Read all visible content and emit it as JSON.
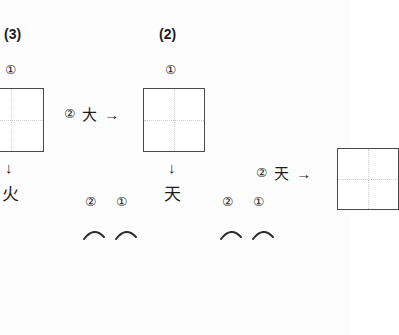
{
  "page": {
    "kind": "chinese-character-stroke-practice-worksheet",
    "background_color": "#fdfdfd",
    "ink_color": "#1e1e1e",
    "box_border_color": "#4a4a4a",
    "guide_line_color": "#cfcfcf"
  },
  "exercises": [
    {
      "id": "exercise-3",
      "number_label": "(3)",
      "top_stroke_number": "①",
      "box": {
        "clipped_edge": "left",
        "has_dotted_guides": true
      },
      "down_arrow": "↓",
      "result_character": "火"
    },
    {
      "id": "exercise-2",
      "number_label": "(2)",
      "top_stroke_number": "①",
      "prompt": {
        "stroke_number": "②",
        "character": "大",
        "arrow": "→"
      },
      "box": {
        "clipped_edge": "none",
        "has_dotted_guides": true
      },
      "down_arrow": "↓",
      "result_character": "天"
    },
    {
      "id": "exercise-1",
      "prompt": {
        "stroke_number": "②",
        "character": "天",
        "arrow": "→"
      },
      "box": {
        "clipped_edge": "right",
        "has_dotted_guides": true
      }
    }
  ],
  "stroke_order_groups": [
    {
      "id": "stroke-group-center",
      "numbers": [
        "②",
        "①"
      ],
      "strokes": [
        "arc",
        "arc"
      ]
    },
    {
      "id": "stroke-group-right",
      "numbers": [
        "②",
        "①"
      ],
      "strokes": [
        "arc",
        "arc"
      ]
    }
  ]
}
